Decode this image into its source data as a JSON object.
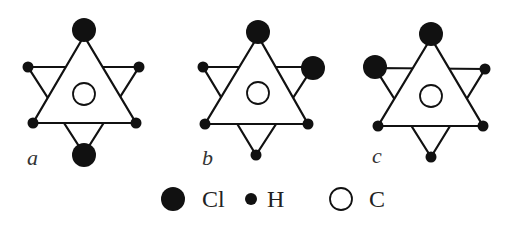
{
  "colors": {
    "ink": "#111111",
    "bg": "#ffffff"
  },
  "radii": {
    "Cl": 12,
    "H": 5.5,
    "C": 11
  },
  "molecules": [
    {
      "label": "a",
      "label_pos": [
        27,
        165
      ],
      "center": [
        84,
        94
      ],
      "up_triangle": [
        [
          84,
          36
        ],
        [
          33,
          123
        ],
        [
          136,
          123
        ]
      ],
      "down_triangle": [
        [
          28,
          67
        ],
        [
          139,
          67
        ],
        [
          84,
          154
        ]
      ],
      "atoms": [
        {
          "el": "Cl",
          "pos": [
            84,
            30
          ]
        },
        {
          "el": "H",
          "pos": [
            28,
            67
          ]
        },
        {
          "el": "H",
          "pos": [
            139,
            67
          ]
        },
        {
          "el": "H",
          "pos": [
            33,
            123
          ]
        },
        {
          "el": "H",
          "pos": [
            136,
            123
          ]
        },
        {
          "el": "Cl",
          "pos": [
            84,
            155
          ]
        }
      ]
    },
    {
      "label": "b",
      "label_pos": [
        202,
        165
      ],
      "center": [
        258,
        93
      ],
      "up_triangle": [
        [
          258,
          36
        ],
        [
          205,
          124
        ],
        [
          308,
          124
        ]
      ],
      "down_triangle": [
        [
          203,
          67
        ],
        [
          313,
          67
        ],
        [
          256,
          155
        ]
      ],
      "atoms": [
        {
          "el": "Cl",
          "pos": [
            258,
            32
          ]
        },
        {
          "el": "H",
          "pos": [
            203,
            67
          ]
        },
        {
          "el": "Cl",
          "pos": [
            313,
            68
          ]
        },
        {
          "el": "H",
          "pos": [
            205,
            124
          ]
        },
        {
          "el": "H",
          "pos": [
            308,
            124
          ]
        },
        {
          "el": "H",
          "pos": [
            256,
            155
          ]
        }
      ]
    },
    {
      "label": "c",
      "label_pos": [
        372,
        163
      ],
      "center": [
        431,
        96
      ],
      "up_triangle": [
        [
          431,
          38
        ],
        [
          378,
          126
        ],
        [
          483,
          126
        ]
      ],
      "down_triangle": [
        [
          375,
          68
        ],
        [
          485,
          69
        ],
        [
          431,
          157
        ]
      ],
      "atoms": [
        {
          "el": "Cl",
          "pos": [
            431,
            34
          ]
        },
        {
          "el": "Cl",
          "pos": [
            375,
            67
          ]
        },
        {
          "el": "H",
          "pos": [
            485,
            69
          ]
        },
        {
          "el": "H",
          "pos": [
            378,
            126
          ]
        },
        {
          "el": "H",
          "pos": [
            483,
            126
          ]
        },
        {
          "el": "H",
          "pos": [
            431,
            157
          ]
        }
      ]
    }
  ],
  "legend": [
    {
      "el": "Cl",
      "symbol": "filled-large",
      "pos": [
        173,
        199
      ],
      "text": "Cl",
      "text_pos": [
        202,
        207
      ]
    },
    {
      "el": "H",
      "symbol": "filled-small",
      "pos": [
        251,
        199
      ],
      "text": "H",
      "text_pos": [
        267,
        207
      ]
    },
    {
      "el": "C",
      "symbol": "open",
      "pos": [
        341,
        199
      ],
      "text": "C",
      "text_pos": [
        369,
        207
      ]
    }
  ]
}
